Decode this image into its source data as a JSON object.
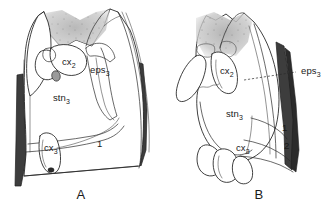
{
  "figure": {
    "type": "scientific-line-drawing",
    "background_color": "#ffffff",
    "ink_color": "#1f1f1f"
  },
  "panels": [
    {
      "id": "A",
      "caption": "A",
      "labels": [
        {
          "id": "cx2-a",
          "base": "cx",
          "sub": "2",
          "x": 62,
          "y": 65,
          "leader": false
        },
        {
          "id": "eps3-a",
          "base": "eps",
          "sub": "3",
          "x": 92,
          "y": 72,
          "leader": false
        },
        {
          "id": "stn3-a",
          "base": "stn",
          "sub": "3",
          "x": 55,
          "y": 100,
          "leader": false
        },
        {
          "id": "cx3-a",
          "base": "cx",
          "sub": "3",
          "x": 46,
          "y": 150,
          "leader": false
        },
        {
          "id": "num1-a",
          "base": "1",
          "sub": "",
          "x": 98,
          "y": 146,
          "leader": false
        }
      ]
    },
    {
      "id": "B",
      "caption": "B",
      "labels": [
        {
          "id": "cx2-b",
          "base": "cx",
          "sub": "2",
          "x": 222,
          "y": 73,
          "leader": false
        },
        {
          "id": "eps3-b",
          "base": "eps",
          "sub": "3",
          "x": 300,
          "y": 73,
          "leader": true
        },
        {
          "id": "stn3-b",
          "base": "stn",
          "sub": "3",
          "x": 228,
          "y": 116,
          "leader": false
        },
        {
          "id": "cx3-b",
          "base": "cx",
          "sub": "3",
          "x": 236,
          "y": 150,
          "leader": false
        },
        {
          "id": "num1-b",
          "base": "1",
          "sub": "",
          "x": 283,
          "y": 130,
          "leader": false
        },
        {
          "id": "num2-b",
          "base": "2",
          "sub": "",
          "x": 285,
          "y": 147,
          "leader": false
        }
      ]
    }
  ],
  "labels_text": {
    "cx2_base": "cx",
    "cx2_sub": "2",
    "cx3_base": "cx",
    "cx3_sub": "3",
    "stn3_base": "stn",
    "stn3_sub": "3",
    "eps3_base": "eps",
    "eps3_sub": "3",
    "num1": "1",
    "num2": "2",
    "caption_a": "A",
    "caption_b": "B"
  },
  "shading": {
    "stipple_color": "#b9b9b9",
    "hatch_color": "#5a5a5a",
    "dark_wedge_color": "#3d3d3d",
    "gray_blob_color": "#9a9a9a"
  }
}
